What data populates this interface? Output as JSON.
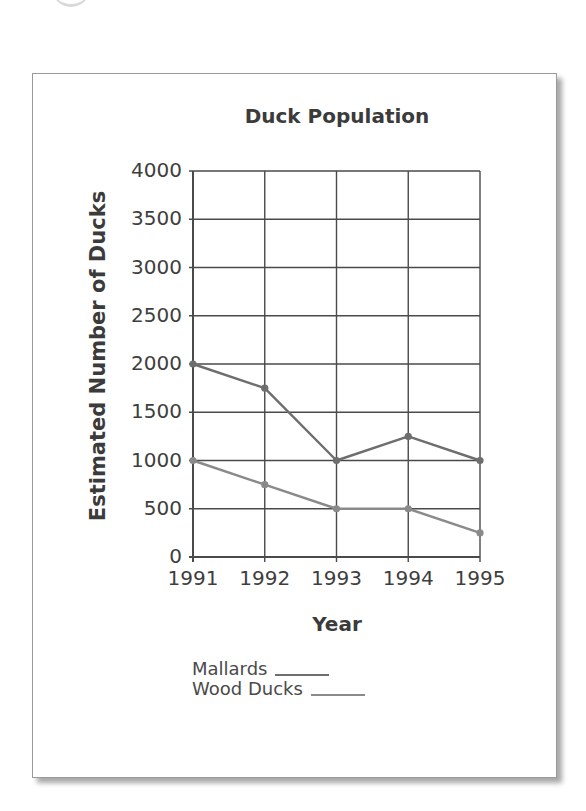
{
  "figure": {
    "title": "Duck Population",
    "xlabel": "Year",
    "ylabel": "Estimated Number of Ducks",
    "y_ticks": [
      "4000",
      "3500",
      "3000",
      "2500",
      "2000",
      "1500",
      "1000",
      "500",
      "0"
    ],
    "x_ticks": [
      "1991",
      "1992",
      "1993",
      "1994",
      "1995"
    ],
    "legend": [
      {
        "label": "Mallards",
        "color": "#6e6e6e"
      },
      {
        "label": "Wood Ducks",
        "color": "#8a8a8a"
      }
    ]
  },
  "chart_data": {
    "type": "line",
    "title": "Duck Population",
    "xlabel": "Year",
    "ylabel": "Estimated Number of Ducks",
    "x": [
      1991,
      1992,
      1993,
      1994,
      1995
    ],
    "categories": [
      "1991",
      "1992",
      "1993",
      "1994",
      "1995"
    ],
    "series": [
      {
        "name": "Mallards",
        "values": [
          2000,
          1750,
          1000,
          1250,
          1000
        ],
        "color": "#6e6e6e"
      },
      {
        "name": "Wood Ducks",
        "values": [
          1000,
          750,
          500,
          500,
          250
        ],
        "color": "#8a8a8a"
      }
    ],
    "ylim": [
      0,
      4000
    ],
    "y_tick_step": 500,
    "grid": true,
    "legend_position": "below plot, left"
  }
}
